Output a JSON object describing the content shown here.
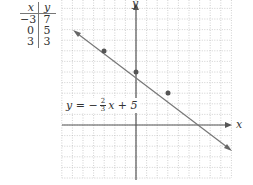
{
  "table": {
    "headers": [
      "x",
      "y"
    ],
    "rows": [
      {
        "x": "−3",
        "y": "7"
      },
      {
        "x": "0",
        "y": "5"
      },
      {
        "x": "3",
        "y": "3"
      }
    ]
  },
  "graph": {
    "x_axis_label": "x",
    "y_axis_label": "y",
    "x_range": [
      -7,
      9
    ],
    "y_range": [
      -5,
      12
    ],
    "grid": "dotted",
    "line_color": "#666666",
    "point_color": "#555555"
  },
  "equation": {
    "lhs": "y = −",
    "frac_num": "2",
    "frac_den": "3",
    "rhs": "x + 5"
  },
  "chart_data": {
    "type": "line",
    "title": "",
    "equation": "y = -2/3 x + 5",
    "points": [
      {
        "x": -3,
        "y": 7
      },
      {
        "x": 0,
        "y": 5
      },
      {
        "x": 3,
        "y": 3
      }
    ],
    "xlabel": "x",
    "ylabel": "y",
    "xlim": [
      -7,
      9
    ],
    "ylim": [
      -5,
      12
    ],
    "grid": true
  }
}
